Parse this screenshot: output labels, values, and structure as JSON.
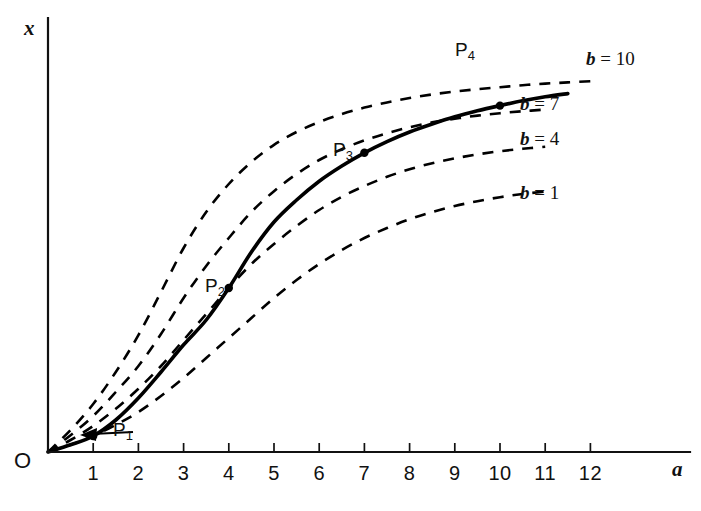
{
  "figure": {
    "background_color": "#ffffff",
    "ink_color": "#000000"
  },
  "axes": {
    "x_axis_name": "a",
    "y_axis_name": "x",
    "origin_label": "O",
    "x_ticks": [
      "1",
      "2",
      "3",
      "4",
      "5",
      "6",
      "7",
      "8",
      "9",
      "10",
      "11",
      "12"
    ],
    "y_ticks": []
  },
  "points": {
    "p1": "P",
    "p1_sub": "1",
    "p2": "P",
    "p2_sub": "2",
    "p3": "P",
    "p3_sub": "3",
    "p4": "P",
    "p4_sub": "4"
  },
  "curve_labels": {
    "b10": "b = 10",
    "b7": "b = 7",
    "b4": "b = 4",
    "b1": "b = 1"
  },
  "chart_data": {
    "type": "line",
    "title": "",
    "xlabel": "a",
    "ylabel": "x",
    "xlim": [
      0,
      13.9
    ],
    "ylim": [
      0,
      1.08
    ],
    "grid": false,
    "legend_position": "right-inline",
    "x_tick_values": [
      1,
      2,
      3,
      4,
      5,
      6,
      7,
      8,
      9,
      10,
      11,
      12
    ],
    "series": [
      {
        "name": "b = 1",
        "style": "dashed",
        "label": "b = 1",
        "label_at_x": 11.2,
        "x": [
          0,
          0.5,
          1,
          1.5,
          2,
          2.5,
          3,
          3.5,
          4,
          4.5,
          5,
          5.5,
          6,
          6.5,
          7,
          7.5,
          8,
          8.5,
          9,
          9.5,
          10,
          10.5,
          11
        ],
        "y": [
          0,
          0.018,
          0.04,
          0.068,
          0.1,
          0.14,
          0.185,
          0.235,
          0.285,
          0.335,
          0.385,
          0.43,
          0.47,
          0.505,
          0.535,
          0.56,
          0.582,
          0.6,
          0.615,
          0.627,
          0.637,
          0.645,
          0.651
        ]
      },
      {
        "name": "b = 4",
        "style": "dashed",
        "label": "b = 4",
        "label_at_x": 11.0,
        "x": [
          0,
          0.5,
          1,
          1.5,
          2,
          2.5,
          3,
          3.5,
          4,
          4.5,
          5,
          5.5,
          6,
          6.5,
          7,
          7.5,
          8,
          8.5,
          9,
          9.5,
          10,
          10.5,
          11
        ],
        "y": [
          0,
          0.03,
          0.065,
          0.108,
          0.158,
          0.215,
          0.28,
          0.345,
          0.41,
          0.47,
          0.52,
          0.565,
          0.605,
          0.638,
          0.665,
          0.688,
          0.707,
          0.722,
          0.734,
          0.744,
          0.752,
          0.758,
          0.763
        ]
      },
      {
        "name": "b = 7",
        "style": "dashed",
        "label": "b = 7",
        "label_at_x": 10.6,
        "x": [
          0,
          0.5,
          1,
          1.5,
          2,
          2.5,
          3,
          3.5,
          4,
          4.5,
          5,
          5.5,
          6,
          6.5,
          7,
          7.5,
          8,
          8.5,
          9,
          9.5,
          10,
          10.5,
          11
        ],
        "y": [
          0,
          0.042,
          0.09,
          0.15,
          0.215,
          0.295,
          0.385,
          0.465,
          0.535,
          0.6,
          0.652,
          0.695,
          0.73,
          0.757,
          0.779,
          0.797,
          0.812,
          0.824,
          0.833,
          0.841,
          0.847,
          0.852,
          0.856
        ]
      },
      {
        "name": "b = 10",
        "style": "dashed",
        "label": "b = 10",
        "label_at_x": 12.2,
        "x": [
          0,
          0.5,
          1,
          1.5,
          2,
          2.5,
          3,
          3.5,
          4,
          4.5,
          5,
          5.5,
          6,
          6.5,
          7,
          7.5,
          8,
          8.5,
          9,
          9.5,
          10,
          10.5,
          11,
          11.5,
          12
        ],
        "y": [
          0,
          0.055,
          0.12,
          0.2,
          0.292,
          0.4,
          0.51,
          0.6,
          0.67,
          0.725,
          0.768,
          0.8,
          0.825,
          0.845,
          0.861,
          0.874,
          0.885,
          0.894,
          0.901,
          0.907,
          0.912,
          0.917,
          0.921,
          0.924,
          0.927
        ]
      },
      {
        "name": "envelope",
        "style": "solid",
        "label": "",
        "x": [
          0,
          0.5,
          1,
          1.5,
          2,
          2.5,
          3,
          3.5,
          4,
          4.5,
          5,
          5.5,
          6,
          6.5,
          7,
          7.5,
          8,
          8.5,
          9,
          9.5,
          10,
          10.5,
          11,
          11.5
        ],
        "y": [
          0,
          0.018,
          0.04,
          0.08,
          0.135,
          0.2,
          0.268,
          0.33,
          0.41,
          0.5,
          0.575,
          0.63,
          0.677,
          0.715,
          0.748,
          0.776,
          0.8,
          0.82,
          0.838,
          0.853,
          0.866,
          0.878,
          0.888,
          0.896
        ]
      }
    ],
    "marked_points": [
      {
        "name": "P1",
        "x": 1,
        "y": 0.04,
        "on_series": "b = 1"
      },
      {
        "name": "P2",
        "x": 4,
        "y": 0.41,
        "on_series": "b = 4"
      },
      {
        "name": "P3",
        "x": 7,
        "y": 0.748,
        "on_series": "b = 7"
      },
      {
        "name": "P4",
        "x": 10,
        "y": 0.866,
        "on_series": "b = 10"
      }
    ]
  }
}
